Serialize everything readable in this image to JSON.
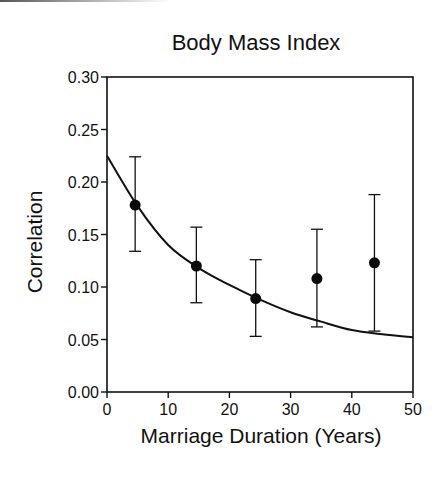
{
  "chart_data": {
    "type": "scatter",
    "title": "Body Mass Index",
    "xlabel": "Marriage Duration (Years)",
    "ylabel": "Correlation",
    "xlim": [
      0,
      50
    ],
    "ylim": [
      0.0,
      0.3
    ],
    "x_ticks": [
      "0",
      "10",
      "20",
      "30",
      "40",
      "50"
    ],
    "y_ticks": [
      "0.00",
      "0.05",
      "0.10",
      "0.15",
      "0.20",
      "0.25",
      "0.30"
    ],
    "grid": false,
    "legend": null,
    "series": [
      {
        "name": "Observed correlation",
        "style": "filled-circle-with-error-bars",
        "points": [
          {
            "x": 4.6,
            "y": 0.178,
            "y_lower": 0.134,
            "y_upper": 0.224
          },
          {
            "x": 14.6,
            "y": 0.12,
            "y_lower": 0.085,
            "y_upper": 0.157
          },
          {
            "x": 24.3,
            "y": 0.089,
            "y_lower": 0.053,
            "y_upper": 0.126
          },
          {
            "x": 34.3,
            "y": 0.108,
            "y_lower": 0.062,
            "y_upper": 0.155
          },
          {
            "x": 43.7,
            "y": 0.123,
            "y_lower": 0.058,
            "y_upper": 0.188
          }
        ]
      },
      {
        "name": "Fitted curve",
        "style": "line",
        "points": [
          {
            "x": 0,
            "y": 0.225
          },
          {
            "x": 5,
            "y": 0.177
          },
          {
            "x": 10,
            "y": 0.14
          },
          {
            "x": 15,
            "y": 0.118
          },
          {
            "x": 20,
            "y": 0.102
          },
          {
            "x": 25,
            "y": 0.088
          },
          {
            "x": 30,
            "y": 0.076
          },
          {
            "x": 35,
            "y": 0.067
          },
          {
            "x": 40,
            "y": 0.059
          },
          {
            "x": 45,
            "y": 0.055
          },
          {
            "x": 50,
            "y": 0.052
          }
        ]
      }
    ]
  }
}
